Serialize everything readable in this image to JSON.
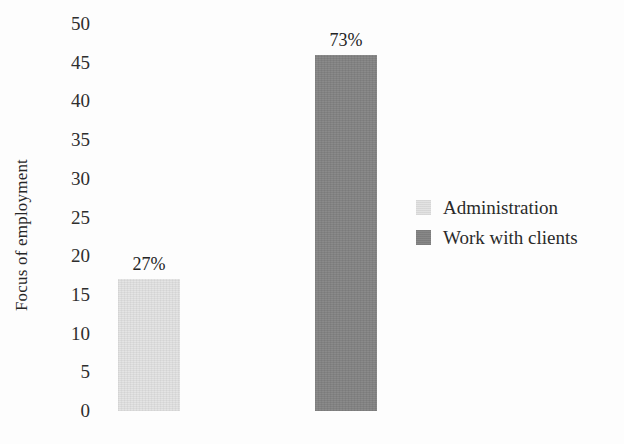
{
  "chart_data": {
    "type": "bar",
    "title": "",
    "subtitle": "",
    "xlabel": "",
    "ylabel": "Focus of employment",
    "ylim": [
      0,
      50
    ],
    "ytick_step": 5,
    "ytick_labels": [
      "50",
      "45",
      "40",
      "35",
      "30",
      "25",
      "20",
      "15",
      "10",
      "5",
      "0"
    ],
    "ytick_values": [
      50,
      45,
      40,
      35,
      30,
      25,
      20,
      15,
      10,
      5,
      0
    ],
    "grid": false,
    "axis_lines": false,
    "legend_position": "right",
    "categories": [
      "Administration",
      "Work with clients"
    ],
    "values": [
      17,
      46
    ],
    "data_labels": [
      "27%",
      "73%"
    ],
    "bars": [
      {
        "category": "Administration",
        "value": 17,
        "data_label": "27%",
        "color": "#e2e2e2"
      },
      {
        "category": "Work with clients",
        "value": 46,
        "data_label": "73%",
        "color": "#838383"
      }
    ],
    "legend": [
      {
        "label": "Administration",
        "color": "#e2e2e2"
      },
      {
        "label": "Work with clients",
        "color": "#838383"
      }
    ]
  }
}
